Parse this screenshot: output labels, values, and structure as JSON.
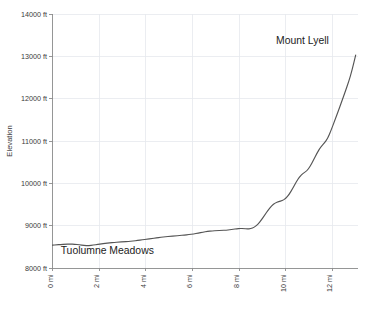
{
  "chart_data": {
    "type": "line",
    "title": "",
    "xlabel": "",
    "ylabel": "Elevation",
    "xlim": [
      0,
      13.1
    ],
    "ylim": [
      8000,
      14000
    ],
    "grid": true,
    "legend": "none",
    "x_unit": "mi",
    "y_unit": "ft",
    "xticks": [
      0,
      2,
      4,
      6,
      8,
      10,
      12
    ],
    "xticklabels": [
      "0 mi",
      "2 mi",
      "4 mi",
      "6 mi",
      "8 mi",
      "10 mi",
      "12 mi"
    ],
    "yticks": [
      8000,
      9000,
      10000,
      11000,
      12000,
      13000,
      14000
    ],
    "yticklabels": [
      "8000 ft",
      "9000 ft",
      "10000 ft",
      "11000 ft",
      "12000 ft",
      "13000 ft",
      "14000 ft"
    ],
    "series": [
      {
        "name": "Elevation profile",
        "color": "#555555",
        "x": [
          0.0,
          0.18,
          0.35,
          0.55,
          0.75,
          0.95,
          1.15,
          1.35,
          1.55,
          1.75,
          1.95,
          2.1,
          2.25,
          2.45,
          2.65,
          2.85,
          3.05,
          3.25,
          3.45,
          3.65,
          3.85,
          4.05,
          4.25,
          4.45,
          4.65,
          4.85,
          5.05,
          5.25,
          5.45,
          5.65,
          5.85,
          6.05,
          6.25,
          6.45,
          6.65,
          6.85,
          7.05,
          7.25,
          7.45,
          7.6,
          7.75,
          7.9,
          8.05,
          8.2,
          8.35,
          8.5,
          8.65,
          8.8,
          8.95,
          9.1,
          9.25,
          9.4,
          9.55,
          9.7,
          9.85,
          10.0,
          10.15,
          10.3,
          10.45,
          10.6,
          10.75,
          10.9,
          11.05,
          11.2,
          11.35,
          11.5,
          11.65,
          11.8,
          11.95,
          12.1,
          12.25,
          12.4,
          12.55,
          12.7,
          12.85,
          13.0
        ],
        "y": [
          8540,
          8548,
          8556,
          8562,
          8566,
          8562,
          8548,
          8530,
          8528,
          8540,
          8556,
          8570,
          8582,
          8594,
          8604,
          8612,
          8620,
          8628,
          8638,
          8650,
          8664,
          8680,
          8696,
          8712,
          8726,
          8738,
          8748,
          8758,
          8768,
          8778,
          8790,
          8804,
          8824,
          8848,
          8866,
          8876,
          8882,
          8888,
          8894,
          8902,
          8916,
          8928,
          8934,
          8930,
          8922,
          8928,
          8960,
          9030,
          9130,
          9250,
          9370,
          9470,
          9540,
          9570,
          9590,
          9640,
          9740,
          9880,
          10030,
          10160,
          10240,
          10290,
          10400,
          10560,
          10720,
          10860,
          10950,
          11060,
          11260,
          11480,
          11700,
          11930,
          12160,
          12400,
          12680,
          13030
        ]
      }
    ],
    "annotations": [
      {
        "id": "start-annotation",
        "text": "Tuolumne Meadows",
        "x_mi": 0.35,
        "y_ft": 8340,
        "anchor": "start"
      },
      {
        "id": "peak-annotation",
        "text": "Mount Lyell",
        "x_mi": 11.85,
        "y_ft": 13280,
        "anchor": "end"
      }
    ]
  }
}
